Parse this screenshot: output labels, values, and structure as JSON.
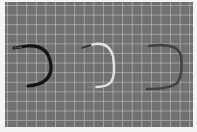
{
  "image": {
    "description": "Photo of three U-shaped wire/tube samples laid on a gray gridded cutting mat",
    "background_color": "#707070",
    "grid_color": "#c8c8c8",
    "objects": [
      {
        "name": "black-u-wire",
        "color": "#141414",
        "position": "left"
      },
      {
        "name": "white-u-wire",
        "color": "#e2e2e2",
        "position": "center"
      },
      {
        "name": "dark-gray-u-wire",
        "color": "#3c3c3c",
        "position": "right"
      }
    ]
  }
}
